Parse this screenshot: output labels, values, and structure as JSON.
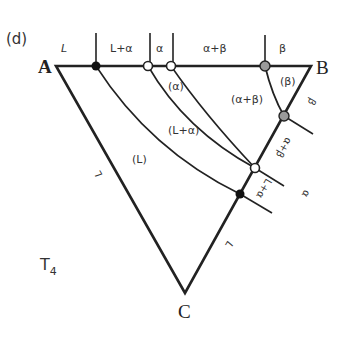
{
  "panel_label": "(d)",
  "temperature_label": "T",
  "temperature_subscript": "4",
  "vertices": {
    "A": "A",
    "B": "B",
    "C": "C"
  },
  "top_edge_labels": {
    "L": "L",
    "L_alpha": "L+α",
    "alpha": "α",
    "alpha_beta": "α+β",
    "beta": "β"
  },
  "region_labels": {
    "liquid": "(L)",
    "liquid_alpha": "(L+α)",
    "alpha": "(α)",
    "alpha_beta": "(α+β)",
    "beta": "(β)"
  },
  "side_labels": {
    "AC_L": "L",
    "BC_beta": "β",
    "BC_alpha_beta": "α+β",
    "BC_alpha": "α",
    "BC_L_alpha": "L+α",
    "BC_L": "L"
  },
  "colors": {
    "line": "#222222",
    "filled_point": "#111111",
    "open_point": "#ffffff",
    "gray_point": "#9a9a9a"
  }
}
